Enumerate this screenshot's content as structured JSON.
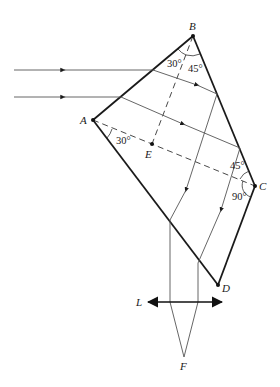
{
  "figure": {
    "type": "optics-diagram",
    "points": {
      "A": {
        "label": "A",
        "x": 93,
        "y": 120
      },
      "B": {
        "label": "B",
        "x": 193,
        "y": 36
      },
      "C": {
        "label": "C",
        "x": 255,
        "y": 186
      },
      "D": {
        "label": "D",
        "x": 218,
        "y": 285
      },
      "E": {
        "label": "E",
        "x": 152,
        "y": 144
      },
      "F": {
        "label": "F",
        "x": 184,
        "y": 357
      }
    },
    "lens": {
      "label": "L"
    },
    "angles": {
      "ABE": "30°",
      "EBC": "45°",
      "EAD": "30°",
      "ACB": "45°",
      "ACD": "90°"
    },
    "colors": {
      "prism": "#1a1a1a",
      "ray": "#555555",
      "dashed": "#333333"
    }
  }
}
